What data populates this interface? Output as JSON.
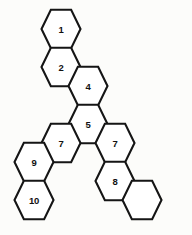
{
  "diagram": {
    "type": "hexagon-tiling",
    "background_color": "#fcfcfa",
    "cell_fill_color": "#ffffff",
    "cell_stroke_color": "#151515",
    "label_color": "#111111",
    "geometry": {
      "orientation": "flat-top",
      "radius": 19.5,
      "column_step_x": 27,
      "row_step_y": 38,
      "half_row_step_y": 19
    },
    "cells": [
      {
        "id": "cell-1",
        "label": "1",
        "cx": 61,
        "cy": 29,
        "labeled": true
      },
      {
        "id": "cell-2",
        "label": "2",
        "cx": 61,
        "cy": 67,
        "labeled": true
      },
      {
        "id": "cell-4",
        "label": "4",
        "cx": 88,
        "cy": 86,
        "labeled": true
      },
      {
        "id": "cell-5",
        "label": "5",
        "cx": 88,
        "cy": 124,
        "labeled": true
      },
      {
        "id": "cell-7a",
        "label": "7",
        "cx": 61,
        "cy": 143,
        "labeled": true
      },
      {
        "id": "cell-7b",
        "label": "7",
        "cx": 115,
        "cy": 143,
        "labeled": true
      },
      {
        "id": "cell-9",
        "label": "9",
        "cx": 34,
        "cy": 162,
        "labeled": true
      },
      {
        "id": "cell-10",
        "label": "10",
        "cx": 34,
        "cy": 200,
        "labeled": true
      },
      {
        "id": "cell-8",
        "label": "8",
        "cx": 115,
        "cy": 181,
        "labeled": true
      },
      {
        "id": "cell-blank",
        "label": "",
        "cx": 142,
        "cy": 200,
        "labeled": false
      }
    ],
    "labels": {
      "cell_1": "1",
      "cell_2": "2",
      "cell_4": "4",
      "cell_5": "5",
      "cell_7a": "7",
      "cell_7b": "7",
      "cell_8": "8",
      "cell_9": "9",
      "cell_10": "10",
      "cell_blank": ""
    }
  }
}
